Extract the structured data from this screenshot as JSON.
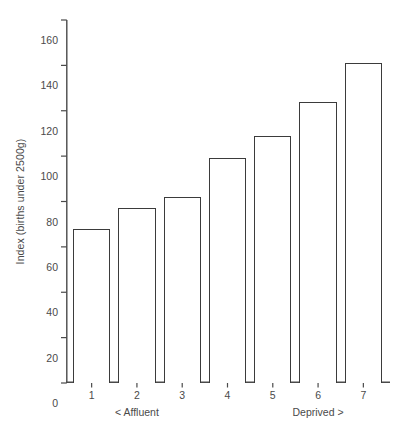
{
  "chart_data": {
    "type": "bar",
    "title": "",
    "subtitle": "",
    "xlabel": "",
    "ylabel": "Index (births under 2500g)",
    "categories": [
      "1",
      "2",
      "3",
      "4",
      "5",
      "6",
      "7"
    ],
    "values": [
      68,
      77,
      82,
      99,
      109,
      124,
      141
    ],
    "ylim": [
      0,
      160
    ],
    "yticks": [
      0,
      20,
      40,
      60,
      80,
      100,
      120,
      140,
      160
    ],
    "ytick_labels": [
      "0",
      "20",
      "40",
      "60",
      "80",
      "100",
      "120",
      "140",
      "160"
    ],
    "grid": false,
    "legend": null,
    "legend_position": "none",
    "annotations": [
      {
        "name": "affluent-annotation",
        "text": "< Affluent",
        "near_category": "2"
      },
      {
        "name": "deprived-annotation",
        "text": "Deprived >",
        "near_category": "6"
      }
    ],
    "series": [
      {
        "name": "Index (births under 2500g)",
        "values": [
          68,
          77,
          82,
          99,
          109,
          124,
          141
        ]
      }
    ],
    "style": {
      "bar_fill": "#ffffff",
      "bar_stroke": "#3b3b3b",
      "axis_color": "#4a4a4a",
      "text_color": "#4a4a4a",
      "background": "#ffffff"
    }
  }
}
